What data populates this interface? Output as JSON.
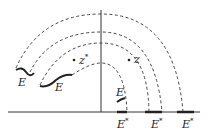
{
  "diagram": {
    "type": "complex-plane arcs",
    "axes": {
      "origin_x": 101,
      "axis_y": 112
    },
    "labels": {
      "e_left_1": "E",
      "e_left_2": "E",
      "e_small": "E",
      "e_star": "E",
      "star": "*",
      "z": "z",
      "z_star": "z",
      "z_star_sup": "*"
    },
    "colors": {
      "line": "#222222",
      "dashed": "#444444"
    }
  }
}
